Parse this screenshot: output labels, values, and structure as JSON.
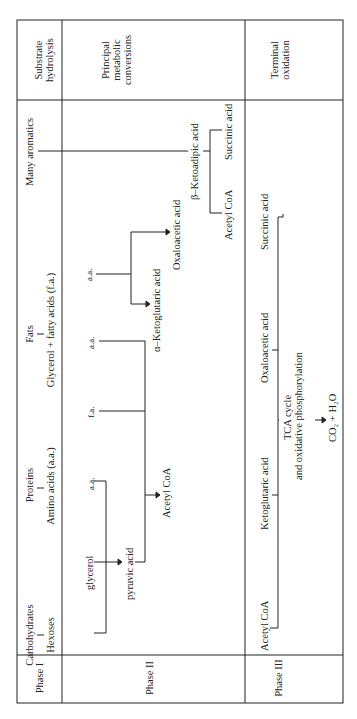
{
  "page_header": "General Microbiology and Biotechnology",
  "columns": {
    "phase_1": "Phase I",
    "phase_2": "Phase II",
    "phase_3": "Phase III"
  },
  "row_headers": {
    "substrate_hydrolysis": [
      "Substrate",
      "hydrolysis"
    ],
    "principal_conversions": [
      "Principal",
      "metabolic",
      "conversions"
    ],
    "terminal_oxidation": [
      "Terminal",
      "oxidation"
    ]
  },
  "substrates": {
    "carbohydrates": "Carbohydrates",
    "hexoses": "Hexoses",
    "proteins": "Proteins",
    "amino_acids": "Amino acids (a.a.)",
    "fats": "Fats",
    "glycerol_fatty_acids": "Glycerol + fatty acids (f.a.)",
    "many_aromatics": "Many aromatics"
  },
  "phase2": {
    "glycerol": "glycerol",
    "aa_1": "a.a.",
    "pyruvic_acid": "pyruvic acid",
    "fa": "f.a.",
    "aa_2": "a.a.",
    "acetyl_coa": "Acetyl CoA",
    "aa_3": "a.a.",
    "alpha_ketoglutaric": "α–Ketoglutaric acid",
    "oxaloacetic": "Oxaloacetic acid",
    "beta_ketoadipic": "β–Ketoadipic acid",
    "acetyl_coa_2": "Acetyl CoA",
    "succinic_acid": "Succinic acid"
  },
  "phase3": {
    "acetyl_coa": "Acetyl CoA",
    "ketoglutaric": "Ketoglutaric acid",
    "oxaloacetic": "Oxaloacetic acid",
    "succinic": "Succinic acid",
    "tca_line1": "TCA cycle",
    "tca_line2": "and oxidative phosphorylation",
    "products": "CO₂ + H₂O"
  },
  "colors": {
    "ink": "#222222",
    "background": "#ffffff"
  }
}
